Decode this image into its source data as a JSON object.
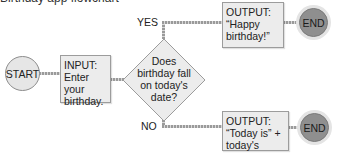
{
  "title": "Birthday app flowchart",
  "nodes": {
    "start": {
      "label": "START"
    },
    "input": {
      "line1": "INPUT:",
      "line2": "Enter your",
      "line3": "birthday."
    },
    "decision": {
      "line1": "Does",
      "line2": "birthday fall",
      "line3": "on today's",
      "line4": "date?"
    },
    "output_yes": {
      "line1": "OUTPUT:",
      "line2": "“Happy",
      "line3": "birthday!”"
    },
    "output_no": {
      "line1": "OUTPUT:",
      "line2": "“Today is” +",
      "line3": "today's date."
    },
    "end_yes": {
      "label": "END"
    },
    "end_no": {
      "label": "END"
    }
  },
  "branches": {
    "yes": "YES",
    "no": "NO"
  },
  "colors": {
    "box_fill": "#ececec",
    "end_fill": "#8f8f8f",
    "start_fill": "#e6e6e6",
    "connector": "#9a9a9a"
  }
}
